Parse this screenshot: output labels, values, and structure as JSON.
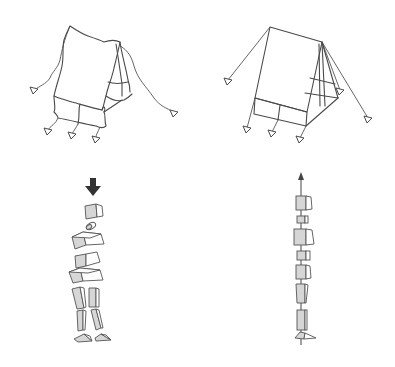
{
  "diagram": {
    "panels": [
      {
        "id": "messy-tent",
        "description": "Sagging, disorganized tent with wavy guy ropes"
      },
      {
        "id": "ordered-tent",
        "description": "Taut, well-pitched A-frame tent with straight guy ropes"
      },
      {
        "id": "misaligned-body",
        "description": "Stack of misaligned body blocks pressed down by downward arrow"
      },
      {
        "id": "aligned-body",
        "description": "Stack of body blocks aligned along a vertical upward axis"
      }
    ],
    "icons": {
      "down-arrow": "downward pressure",
      "up-arrow": "vertical alignment axis"
    },
    "colors": {
      "stroke": "#4a4a4a",
      "block_fill": "#d6d6d6",
      "arrow": "#333333"
    }
  }
}
